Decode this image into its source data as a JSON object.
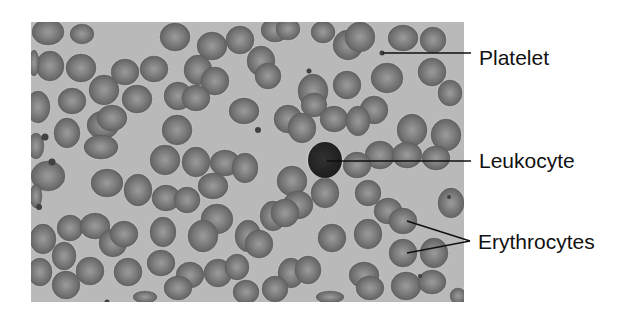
{
  "figure": {
    "colors": {
      "page_background": "#ffffff",
      "smear_background": "#b9b9b9",
      "erythrocyte_rim": "#5e5e5e",
      "erythrocyte_center": "#9a9a9a",
      "leukocyte": "#151515",
      "platelet": "#3a3a3a",
      "leader_line": "#111111",
      "label_text": "#111111"
    },
    "micrograph": {
      "x": 31,
      "y": 22,
      "width": 433,
      "height": 280
    },
    "labels": [
      {
        "id": "platelet",
        "text": "Platelet",
        "text_x": 479,
        "text_y": 47,
        "lines": [
          {
            "x1": 383,
            "y1": 53,
            "x2": 471,
            "y2": 53
          }
        ],
        "targets": [
          {
            "x": 382,
            "y": 53
          }
        ]
      },
      {
        "id": "leukocyte",
        "text": "Leukocyte",
        "text_x": 479,
        "text_y": 150,
        "lines": [
          {
            "x1": 327,
            "y1": 161,
            "x2": 471,
            "y2": 161
          }
        ],
        "targets": [
          {
            "x": 325,
            "y": 160
          }
        ]
      },
      {
        "id": "erythrocytes",
        "text": "Erythrocytes",
        "text_x": 478,
        "text_y": 231,
        "lines": [
          {
            "x1": 407,
            "y1": 221,
            "x2": 470,
            "y2": 241
          },
          {
            "x1": 407,
            "y1": 253,
            "x2": 470,
            "y2": 241
          }
        ],
        "targets": [
          {
            "x": 403,
            "y": 219
          },
          {
            "x": 403,
            "y": 253
          }
        ]
      }
    ],
    "leukocyte": {
      "cx": 325,
      "cy": 160,
      "r": 17
    },
    "platelets": [
      {
        "cx": 382,
        "cy": 53,
        "r": 2.5
      },
      {
        "cx": 309,
        "cy": 71,
        "r": 2.5
      },
      {
        "cx": 258,
        "cy": 130,
        "r": 3
      },
      {
        "cx": 45,
        "cy": 137,
        "r": 3.5
      },
      {
        "cx": 52,
        "cy": 162,
        "r": 3.5
      },
      {
        "cx": 39,
        "cy": 207,
        "r": 3
      },
      {
        "cx": 449,
        "cy": 197,
        "r": 2
      },
      {
        "cx": 420,
        "cy": 276,
        "r": 2
      },
      {
        "cx": 107,
        "cy": 302,
        "r": 2.5
      }
    ],
    "erythrocytes": [
      {
        "cx": 48,
        "cy": 32,
        "rx": 16,
        "ry": 13
      },
      {
        "cx": 82,
        "cy": 34,
        "rx": 12,
        "ry": 10
      },
      {
        "cx": 50,
        "cy": 66,
        "rx": 14,
        "ry": 15
      },
      {
        "cx": 81,
        "cy": 68,
        "rx": 15,
        "ry": 14
      },
      {
        "cx": 34,
        "cy": 63,
        "rx": 5,
        "ry": 13
      },
      {
        "cx": 104,
        "cy": 90,
        "rx": 15,
        "ry": 15
      },
      {
        "cx": 72,
        "cy": 101,
        "rx": 14,
        "ry": 13
      },
      {
        "cx": 38,
        "cy": 107,
        "rx": 12,
        "ry": 16
      },
      {
        "cx": 125,
        "cy": 72,
        "rx": 14,
        "ry": 13
      },
      {
        "cx": 154,
        "cy": 69,
        "rx": 14,
        "ry": 13
      },
      {
        "cx": 137,
        "cy": 99,
        "rx": 15,
        "ry": 14
      },
      {
        "cx": 103,
        "cy": 125,
        "rx": 16,
        "ry": 14
      },
      {
        "cx": 112,
        "cy": 118,
        "rx": 15,
        "ry": 13
      },
      {
        "cx": 67,
        "cy": 133,
        "rx": 13,
        "ry": 15
      },
      {
        "cx": 36,
        "cy": 146,
        "rx": 8,
        "ry": 13
      },
      {
        "cx": 101,
        "cy": 147,
        "rx": 17,
        "ry": 12
      },
      {
        "cx": 175,
        "cy": 37,
        "rx": 15,
        "ry": 14
      },
      {
        "cx": 212,
        "cy": 46,
        "rx": 15,
        "ry": 14
      },
      {
        "cx": 240,
        "cy": 40,
        "rx": 14,
        "ry": 14
      },
      {
        "cx": 198,
        "cy": 70,
        "rx": 14,
        "ry": 15
      },
      {
        "cx": 215,
        "cy": 81,
        "rx": 14,
        "ry": 14
      },
      {
        "cx": 178,
        "cy": 96,
        "rx": 14,
        "ry": 14
      },
      {
        "cx": 196,
        "cy": 98,
        "rx": 14,
        "ry": 13
      },
      {
        "cx": 244,
        "cy": 111,
        "rx": 15,
        "ry": 13
      },
      {
        "cx": 177,
        "cy": 130,
        "rx": 15,
        "ry": 15
      },
      {
        "cx": 275,
        "cy": 30,
        "rx": 14,
        "ry": 12
      },
      {
        "cx": 288,
        "cy": 29,
        "rx": 12,
        "ry": 11
      },
      {
        "cx": 323,
        "cy": 32,
        "rx": 12,
        "ry": 11
      },
      {
        "cx": 348,
        "cy": 45,
        "rx": 15,
        "ry": 15
      },
      {
        "cx": 360,
        "cy": 37,
        "rx": 15,
        "ry": 15
      },
      {
        "cx": 403,
        "cy": 38,
        "rx": 15,
        "ry": 13
      },
      {
        "cx": 433,
        "cy": 40,
        "rx": 13,
        "ry": 13
      },
      {
        "cx": 261,
        "cy": 61,
        "rx": 14,
        "ry": 15
      },
      {
        "cx": 268,
        "cy": 76,
        "rx": 13,
        "ry": 13
      },
      {
        "cx": 313,
        "cy": 91,
        "rx": 15,
        "ry": 17
      },
      {
        "cx": 314,
        "cy": 105,
        "rx": 13,
        "ry": 12
      },
      {
        "cx": 347,
        "cy": 85,
        "rx": 14,
        "ry": 14
      },
      {
        "cx": 387,
        "cy": 78,
        "rx": 16,
        "ry": 15
      },
      {
        "cx": 432,
        "cy": 72,
        "rx": 14,
        "ry": 14
      },
      {
        "cx": 450,
        "cy": 93,
        "rx": 12,
        "ry": 13
      },
      {
        "cx": 374,
        "cy": 110,
        "rx": 14,
        "ry": 14
      },
      {
        "cx": 412,
        "cy": 130,
        "rx": 15,
        "ry": 16
      },
      {
        "cx": 446,
        "cy": 135,
        "rx": 15,
        "ry": 16
      },
      {
        "cx": 288,
        "cy": 119,
        "rx": 14,
        "ry": 14
      },
      {
        "cx": 302,
        "cy": 128,
        "rx": 14,
        "ry": 15
      },
      {
        "cx": 334,
        "cy": 119,
        "rx": 14,
        "ry": 13
      },
      {
        "cx": 358,
        "cy": 121,
        "rx": 12,
        "ry": 15
      },
      {
        "cx": 380,
        "cy": 155,
        "rx": 15,
        "ry": 14
      },
      {
        "cx": 407,
        "cy": 155,
        "rx": 15,
        "ry": 13
      },
      {
        "cx": 436,
        "cy": 158,
        "rx": 14,
        "ry": 12
      },
      {
        "cx": 357,
        "cy": 165,
        "rx": 14,
        "ry": 13
      },
      {
        "cx": 196,
        "cy": 162,
        "rx": 14,
        "ry": 15
      },
      {
        "cx": 225,
        "cy": 163,
        "rx": 15,
        "ry": 13
      },
      {
        "cx": 213,
        "cy": 186,
        "rx": 15,
        "ry": 13
      },
      {
        "cx": 245,
        "cy": 168,
        "rx": 13,
        "ry": 15
      },
      {
        "cx": 165,
        "cy": 160,
        "rx": 15,
        "ry": 15
      },
      {
        "cx": 138,
        "cy": 190,
        "rx": 14,
        "ry": 16
      },
      {
        "cx": 107,
        "cy": 183,
        "rx": 16,
        "ry": 14
      },
      {
        "cx": 48,
        "cy": 176,
        "rx": 17,
        "ry": 15
      },
      {
        "cx": 36,
        "cy": 196,
        "rx": 6,
        "ry": 12
      },
      {
        "cx": 166,
        "cy": 198,
        "rx": 14,
        "ry": 13
      },
      {
        "cx": 187,
        "cy": 200,
        "rx": 13,
        "ry": 13
      },
      {
        "cx": 217,
        "cy": 219,
        "rx": 16,
        "ry": 15
      },
      {
        "cx": 292,
        "cy": 181,
        "rx": 15,
        "ry": 15
      },
      {
        "cx": 298,
        "cy": 205,
        "rx": 15,
        "ry": 14
      },
      {
        "cx": 325,
        "cy": 193,
        "rx": 14,
        "ry": 15
      },
      {
        "cx": 368,
        "cy": 193,
        "rx": 13,
        "ry": 13
      },
      {
        "cx": 388,
        "cy": 211,
        "rx": 14,
        "ry": 13
      },
      {
        "cx": 403,
        "cy": 221,
        "rx": 14,
        "ry": 13
      },
      {
        "cx": 451,
        "cy": 203,
        "rx": 13,
        "ry": 15
      },
      {
        "cx": 273,
        "cy": 216,
        "rx": 13,
        "ry": 15
      },
      {
        "cx": 285,
        "cy": 213,
        "rx": 14,
        "ry": 14
      },
      {
        "cx": 332,
        "cy": 238,
        "rx": 14,
        "ry": 14
      },
      {
        "cx": 368,
        "cy": 234,
        "rx": 14,
        "ry": 15
      },
      {
        "cx": 403,
        "cy": 253,
        "rx": 14,
        "ry": 14
      },
      {
        "cx": 434,
        "cy": 253,
        "rx": 14,
        "ry": 15
      },
      {
        "cx": 70,
        "cy": 228,
        "rx": 13,
        "ry": 13
      },
      {
        "cx": 95,
        "cy": 226,
        "rx": 15,
        "ry": 13
      },
      {
        "cx": 43,
        "cy": 239,
        "rx": 13,
        "ry": 15
      },
      {
        "cx": 64,
        "cy": 256,
        "rx": 12,
        "ry": 14
      },
      {
        "cx": 113,
        "cy": 243,
        "rx": 14,
        "ry": 14
      },
      {
        "cx": 124,
        "cy": 234,
        "rx": 14,
        "ry": 13
      },
      {
        "cx": 163,
        "cy": 232,
        "rx": 13,
        "ry": 15
      },
      {
        "cx": 203,
        "cy": 236,
        "rx": 15,
        "ry": 16
      },
      {
        "cx": 248,
        "cy": 236,
        "rx": 13,
        "ry": 16
      },
      {
        "cx": 259,
        "cy": 244,
        "rx": 14,
        "ry": 14
      },
      {
        "cx": 40,
        "cy": 272,
        "rx": 12,
        "ry": 14
      },
      {
        "cx": 66,
        "cy": 285,
        "rx": 14,
        "ry": 14
      },
      {
        "cx": 90,
        "cy": 271,
        "rx": 14,
        "ry": 14
      },
      {
        "cx": 128,
        "cy": 272,
        "rx": 14,
        "ry": 14
      },
      {
        "cx": 161,
        "cy": 263,
        "rx": 14,
        "ry": 13
      },
      {
        "cx": 190,
        "cy": 275,
        "rx": 14,
        "ry": 13
      },
      {
        "cx": 218,
        "cy": 273,
        "rx": 14,
        "ry": 14
      },
      {
        "cx": 237,
        "cy": 267,
        "rx": 12,
        "ry": 13
      },
      {
        "cx": 178,
        "cy": 288,
        "rx": 14,
        "ry": 12
      },
      {
        "cx": 246,
        "cy": 292,
        "rx": 13,
        "ry": 12
      },
      {
        "cx": 291,
        "cy": 273,
        "rx": 13,
        "ry": 15
      },
      {
        "cx": 308,
        "cy": 270,
        "rx": 13,
        "ry": 14
      },
      {
        "cx": 275,
        "cy": 289,
        "rx": 13,
        "ry": 13
      },
      {
        "cx": 364,
        "cy": 275,
        "rx": 15,
        "ry": 13
      },
      {
        "cx": 370,
        "cy": 288,
        "rx": 14,
        "ry": 12
      },
      {
        "cx": 406,
        "cy": 286,
        "rx": 15,
        "ry": 14
      },
      {
        "cx": 432,
        "cy": 282,
        "rx": 14,
        "ry": 12
      },
      {
        "cx": 458,
        "cy": 296,
        "rx": 8,
        "ry": 8
      },
      {
        "cx": 145,
        "cy": 297,
        "rx": 12,
        "ry": 6
      },
      {
        "cx": 330,
        "cy": 297,
        "rx": 14,
        "ry": 6
      }
    ]
  }
}
